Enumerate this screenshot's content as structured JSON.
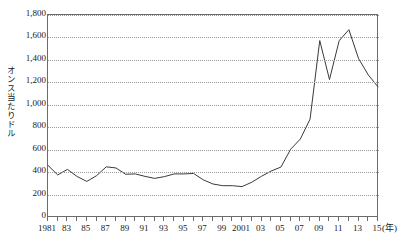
{
  "chart_data": {
    "type": "line",
    "title": "",
    "xlabel": "(年)",
    "ylabel": "オンス当たりドル",
    "xlim": [
      1981,
      2015
    ],
    "ylim": [
      0,
      1800
    ],
    "grid": true,
    "legend": null,
    "y_ticks": [
      0,
      200,
      400,
      600,
      800,
      1000,
      1200,
      1400,
      1600,
      1800
    ],
    "y_tick_labels": [
      "0",
      "200",
      "400",
      "600",
      "800",
      "1,000",
      "1,200",
      "1,400",
      "1,600",
      "1,800"
    ],
    "x_ticks": [
      1981,
      1982,
      1983,
      1984,
      1985,
      1986,
      1987,
      1988,
      1989,
      1990,
      1991,
      1992,
      1993,
      1994,
      1995,
      1996,
      1997,
      1998,
      1999,
      2000,
      2001,
      2002,
      2003,
      2004,
      2005,
      2006,
      2007,
      2008,
      2009,
      2010,
      2011,
      2012,
      2013,
      2014,
      2015
    ],
    "x_tick_labels": [
      "1981",
      "",
      "83",
      "",
      "85",
      "",
      "87",
      "",
      "89",
      "",
      "91",
      "",
      "93",
      "",
      "95",
      "",
      "97",
      "",
      "99",
      "",
      "2001",
      "",
      "03",
      "",
      "05",
      "",
      "07",
      "",
      "09",
      "",
      "11",
      "",
      "13",
      "",
      "15"
    ],
    "x": [
      1981,
      1982,
      1983,
      1984,
      1985,
      1986,
      1987,
      1988,
      1989,
      1990,
      1991,
      1992,
      1993,
      1994,
      1995,
      1996,
      1997,
      1998,
      1999,
      2000,
      2001,
      2002,
      2003,
      2004,
      2005,
      2006,
      2007,
      2008,
      2009,
      2010,
      2011,
      2012,
      2013,
      2014,
      2015
    ],
    "values": [
      460,
      375,
      424,
      361,
      317,
      368,
      447,
      437,
      381,
      384,
      362,
      344,
      360,
      384,
      384,
      388,
      331,
      294,
      279,
      279,
      271,
      310,
      363,
      410,
      445,
      604,
      695,
      872,
      1572,
      1225,
      1571,
      1669,
      1411,
      1266,
      1160
    ],
    "line_color": "#3a3a3a",
    "line_width": 1,
    "frame_color": "#6b6b6b",
    "grid_color": "#9a9a9a",
    "background": "#ffffff"
  }
}
